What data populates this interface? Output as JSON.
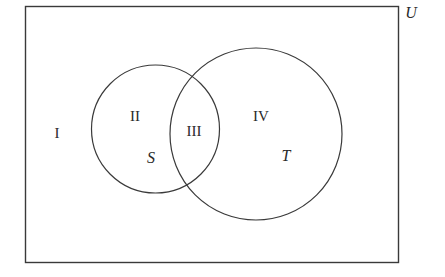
{
  "diagram": {
    "type": "venn",
    "universe": {
      "label": "U",
      "rect": {
        "x": 25,
        "y": 6,
        "width": 373,
        "height": 256
      }
    },
    "sets": [
      {
        "label": "S",
        "cx": 155.5,
        "cy": 129,
        "r": 64
      },
      {
        "label": "T",
        "cx": 256,
        "cy": 134,
        "r": 86
      }
    ],
    "regions": [
      {
        "id": "I",
        "label": "I",
        "x": 57,
        "y": 133
      },
      {
        "id": "II",
        "label": "II",
        "x": 135,
        "y": 116
      },
      {
        "id": "III",
        "label": "III",
        "x": 194,
        "y": 131
      },
      {
        "id": "IV",
        "label": "IV",
        "x": 261,
        "y": 116
      }
    ],
    "stroke_color": "#3a3a3a",
    "background_color": "#ffffff"
  }
}
